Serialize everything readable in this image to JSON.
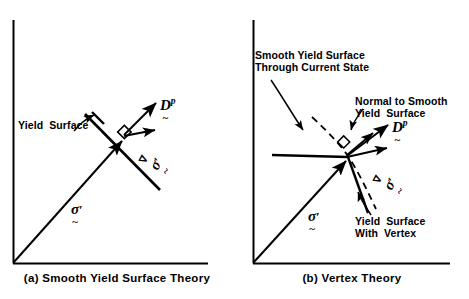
{
  "figure": {
    "background_color": "#ffffff",
    "ink_color": "#000000",
    "width": 469,
    "height": 299
  },
  "panels": [
    {
      "id": "a",
      "caption": "(a) Smooth Yield Surface Theory",
      "annotations": [
        {
          "name": "yield-surface-label",
          "text": "Yield  Surface"
        }
      ],
      "symbols": [
        {
          "name": "plastic-strain-rate",
          "base": "D",
          "superscript": "p",
          "under": "~",
          "over": "",
          "prime": false
        },
        {
          "name": "jaumann-stress-rate",
          "base": "σ",
          "superscript": "",
          "under": "~",
          "over": "∇",
          "prime": true
        },
        {
          "name": "stress-vector",
          "base": "σ",
          "superscript": "",
          "under": "~",
          "over": "",
          "prime": true
        }
      ]
    },
    {
      "id": "b",
      "caption": "(b) Vertex Theory",
      "annotations": [
        {
          "name": "smooth-yield-surface-label",
          "text": "Smooth Yield Surface\nThrough Current State"
        },
        {
          "name": "normal-to-smooth-label",
          "text": "Normal to Smooth\nYield  Surface"
        },
        {
          "name": "yield-surface-vertex-label",
          "text": "Yield  Surface\nWith  Vertex"
        }
      ],
      "symbols": [
        {
          "name": "plastic-strain-rate",
          "base": "D",
          "superscript": "p",
          "under": "~",
          "over": "",
          "prime": false
        },
        {
          "name": "jaumann-stress-rate",
          "base": "σ",
          "superscript": "",
          "under": "~",
          "over": "∇",
          "prime": true
        },
        {
          "name": "stress-vector",
          "base": "σ",
          "superscript": "",
          "under": "~",
          "over": "",
          "prime": true
        }
      ]
    }
  ]
}
